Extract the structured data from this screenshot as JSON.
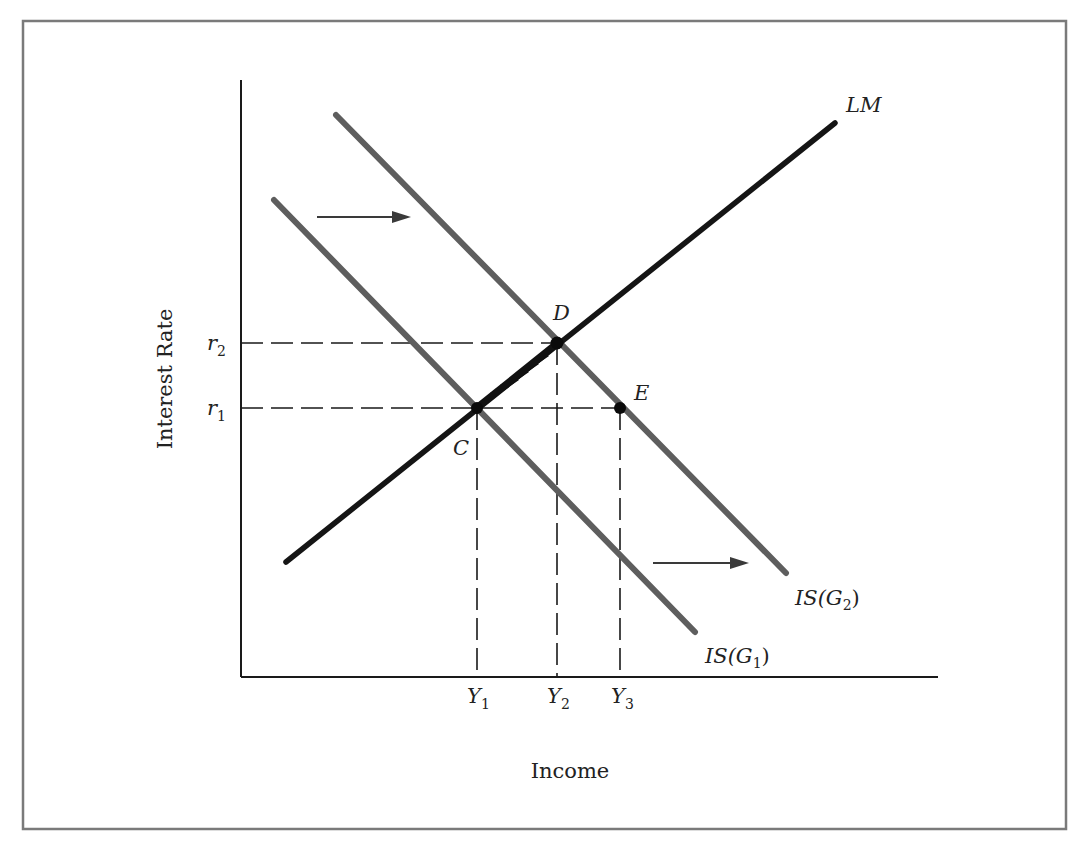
{
  "figure": {
    "type": "IS-LM diagram"
  },
  "axes": {
    "x_label": "Income",
    "y_label": "Interest Rate"
  },
  "y_ticks": [
    {
      "base": "r",
      "sub": "2",
      "id": "r2"
    },
    {
      "base": "r",
      "sub": "1",
      "id": "r1"
    }
  ],
  "x_ticks": [
    {
      "base": "Y",
      "sub": "1",
      "id": "Y1"
    },
    {
      "base": "Y",
      "sub": "2",
      "id": "Y2"
    },
    {
      "base": "Y",
      "sub": "3",
      "id": "Y3"
    }
  ],
  "curves": {
    "lm": {
      "label": "LM"
    },
    "is_g1": {
      "label_prefix": "IS(G",
      "sub": "1",
      "label_suffix": ")"
    },
    "is_g2": {
      "label_prefix": "IS(G",
      "sub": "2",
      "label_suffix": ")"
    }
  },
  "points": {
    "C": {
      "label": "C",
      "at": "r1, Y1",
      "desc": "Initial equilibrium (IS(G1) ∩ LM)"
    },
    "D": {
      "label": "D",
      "at": "r2, Y2",
      "desc": "New equilibrium (IS(G2) ∩ LM)"
    },
    "E": {
      "label": "E",
      "at": "r1, Y3",
      "desc": "IS(G2) at unchanged interest rate r1"
    }
  },
  "annotations": {
    "shift_arrows": 2,
    "shift_direction": "right",
    "adjustment_path": "C to D along LM"
  },
  "colors": {
    "lm_curve": "#151515",
    "is_curves": "#5e5e5e",
    "frame": "#7a7a7a",
    "text": "#222222"
  }
}
